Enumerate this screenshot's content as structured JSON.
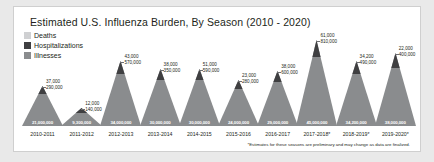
{
  "chart_data": {
    "type": "bar",
    "title": "Estimated U.S. Influenza Burden, By Season (2010 - 2020)",
    "xlabel": "",
    "ylabel": "",
    "legend": [
      {
        "label": "Deaths",
        "color": "#cfd0d2"
      },
      {
        "label": "Hospitalizations",
        "color": "#3f3f41"
      },
      {
        "label": "Illnesses",
        "color": "#8a8c8e"
      }
    ],
    "legend_position": "top-left",
    "grid": false,
    "footnote": "*Estimates for these seasons are preliminary and may change as data are finalized.",
    "categories": [
      "2010-2011",
      "2011-2012",
      "2012-2013",
      "2013-2014",
      "2014-2015",
      "2015-2016",
      "2016-2017",
      "2017-2018*",
      "2018-2019*",
      "2019-2020*"
    ],
    "series": [
      {
        "name": "Deaths",
        "values": [
          37000,
          12000,
          43000,
          38000,
          51000,
          23000,
          38000,
          61000,
          34200,
          22000
        ],
        "labels": [
          "37,000",
          "12,000",
          "43,000",
          "38,000",
          "51,000",
          "23,000",
          "38,000",
          "61,000",
          "34,200",
          "22,000"
        ]
      },
      {
        "name": "Hospitalizations",
        "values": [
          290000,
          140000,
          570000,
          350000,
          590000,
          280000,
          600000,
          810000,
          490000,
          400000
        ],
        "labels": [
          "290,000",
          "140,000",
          "570,000",
          "350,000",
          "590,000",
          "280,000",
          "600,000",
          "810,000",
          "490,000",
          "400,000"
        ]
      },
      {
        "name": "Illnesses",
        "values": [
          21000000,
          9300000,
          34000000,
          30000000,
          30000000,
          24000000,
          29000000,
          45000000,
          34200000,
          38000000
        ],
        "labels": [
          "21,000,000",
          "9,300,000",
          "34,000,000",
          "30,000,000",
          "30,000,000",
          "24,000,000",
          "29,000,000",
          "45,000,000",
          "34,200,000",
          "38,000,000"
        ]
      }
    ],
    "ylim": [
      0,
      45000000
    ]
  }
}
